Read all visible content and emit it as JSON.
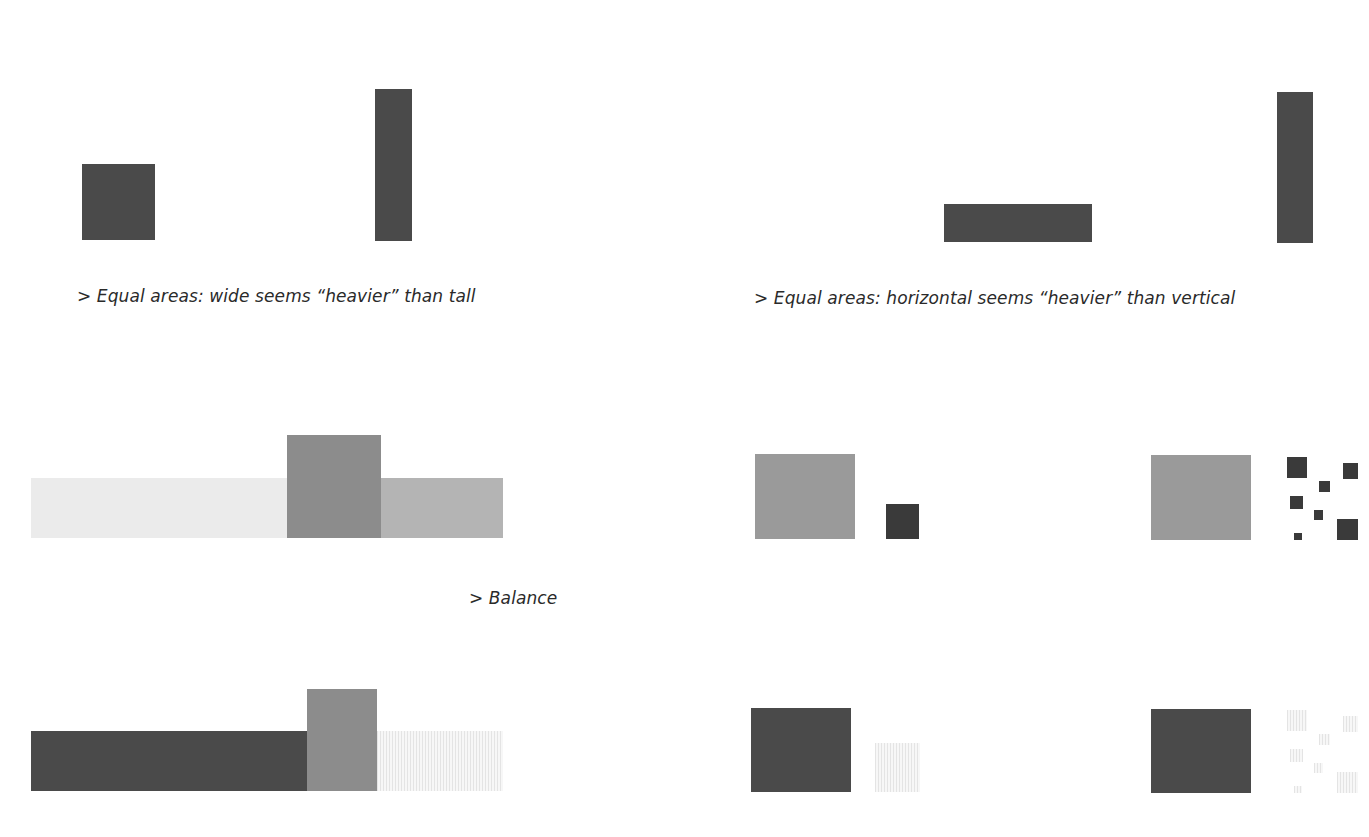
{
  "captions": {
    "wide_tall": "> Equal areas: wide seems “heavier” than tall",
    "horizontal_vertical": "> Equal areas: horizontal seems “heavier” than vertical",
    "balance": "> Balance"
  },
  "colors": {
    "dark": "#4a4a4a",
    "mid": "#8c8c8c",
    "medium_light": "#b4b4b4",
    "light": "#ebebeb",
    "gray_block": "#9a9a9a",
    "faint": "#f2f2f2",
    "background": "#ffffff"
  },
  "panels": [
    {
      "id": "wide-vs-tall",
      "shapes": [
        "square",
        "tall-bar"
      ]
    },
    {
      "id": "horizontal-vs-vertical",
      "shapes": [
        "horizontal-bar",
        "vertical-bar"
      ]
    },
    {
      "id": "balance-light-left",
      "shapes": [
        "light-long-bar",
        "mid-block",
        "medium-bar"
      ]
    },
    {
      "id": "balance-dark-left",
      "shapes": [
        "dark-long-bar",
        "mid-block",
        "light-bar"
      ]
    },
    {
      "id": "gray-vs-dark-small",
      "shapes": [
        "gray-block",
        "small-dark-square"
      ]
    },
    {
      "id": "gray-vs-scattered-dark",
      "shapes": [
        "gray-block",
        "scattered-dark-squares"
      ]
    },
    {
      "id": "dark-vs-faint-small",
      "shapes": [
        "dark-block",
        "small-faint-square"
      ]
    },
    {
      "id": "dark-vs-scattered-faint",
      "shapes": [
        "dark-block",
        "scattered-faint-squares"
      ]
    }
  ]
}
